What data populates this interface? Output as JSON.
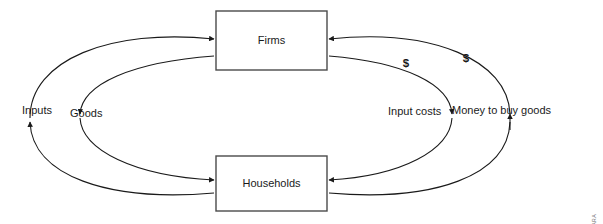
{
  "diagram": {
    "type": "circular-flow",
    "nodes": [
      {
        "id": "firms",
        "label": "Firms"
      },
      {
        "id": "households",
        "label": "Households"
      }
    ],
    "flow_labels": {
      "inputs": "Inputs",
      "goods": "Goods",
      "input_costs": "Input costs",
      "money_to_buy_goods": "Money to buy goods"
    },
    "money_markers": {
      "inner": "$",
      "outer": "$"
    },
    "flows": [
      {
        "id": "inputs",
        "label": "Inputs",
        "from": "households",
        "to": "firms",
        "side": "left",
        "ring": "outer",
        "direction": "down-then-up",
        "kind": "real"
      },
      {
        "id": "goods",
        "label": "Goods",
        "from": "firms",
        "to": "households",
        "side": "left",
        "ring": "inner",
        "direction": "down",
        "kind": "real"
      },
      {
        "id": "input-costs",
        "label": "Input costs",
        "from": "firms",
        "to": "households",
        "side": "right",
        "ring": "inner",
        "direction": "down",
        "kind": "money"
      },
      {
        "id": "money-to-buy-goods",
        "label": "Money to buy goods",
        "from": "households",
        "to": "firms",
        "side": "right",
        "ring": "outer",
        "direction": "up",
        "kind": "money"
      }
    ],
    "source": "SOURCE: JOHN GOWDY AND SABINE O'HARA"
  },
  "colors": {
    "background": "#ffffff",
    "line": "#1a1a1a",
    "box_stroke": "#4a4a4a",
    "text": "#1a1a1a",
    "credit_text": "#6a6a6a"
  }
}
